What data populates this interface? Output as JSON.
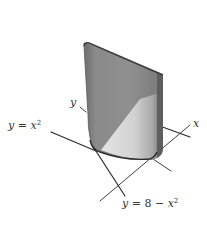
{
  "diagram": {
    "type": "3d-solid-region-sketch",
    "labels": {
      "y_axis": "y",
      "x_axis": "x",
      "curve_left": {
        "lhs": "y",
        "eq": " = ",
        "rhs_var": "x",
        "rhs_exp": "2"
      },
      "curve_right": {
        "lhs": "y",
        "eq": " = 8 − ",
        "rhs_var": "x",
        "rhs_exp": "2"
      }
    },
    "colors": {
      "background": "#ffffff",
      "line": "#2b2b2b",
      "solid_dark": "#7d7d7d",
      "solid_mid": "#9a9a9a",
      "solid_light": "#d6d6d6",
      "solid_edge": "#3a3a3a",
      "text": "#333333"
    }
  }
}
